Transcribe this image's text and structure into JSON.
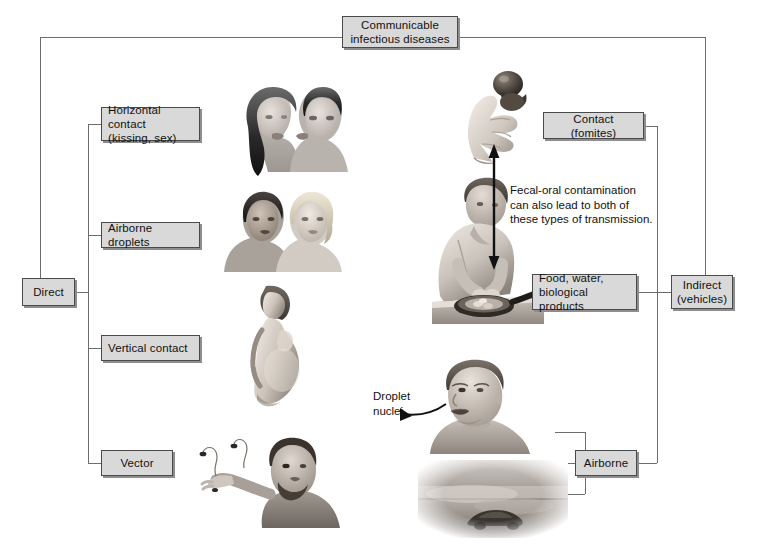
{
  "diagram": {
    "title_box": {
      "line1": "Communicable",
      "line2": "infectious diseases"
    },
    "left_branch": {
      "root_label": "Direct",
      "items": [
        {
          "label_line1": "Horizontal contact",
          "label_line2": "(kissing, sex)",
          "illustration": "couple-kissing-illustration"
        },
        {
          "label_line1": "Airborne droplets",
          "label_line2": "",
          "illustration": "two-women-talking-illustration"
        },
        {
          "label_line1": "Vertical contact",
          "label_line2": "",
          "illustration": "pregnant-woman-illustration"
        },
        {
          "label_line1": "Vector",
          "label_line2": "",
          "illustration": "man-with-insect-illustration"
        }
      ]
    },
    "right_branch": {
      "root_label_line1": "Indirect",
      "root_label_line2": "(vehicles)",
      "items": [
        {
          "label_line1": "Contact (fomites)",
          "label_line2": "",
          "illustration": "hand-holding-doorknob-illustration"
        },
        {
          "label_line1": "Food, water,",
          "label_line2": "biological products",
          "illustration": "person-cooking-illustration"
        },
        {
          "label_line1": "Airborne",
          "label_line2": "",
          "illustration": "man-speaking-droplets-illustration"
        }
      ]
    },
    "annotations": {
      "fecal_oral": {
        "line1": "Fecal-oral contamination",
        "line2": "can also lead to both of",
        "line3": "these types of transmission."
      },
      "droplet_nuclei": {
        "line1": "Droplet",
        "line2": "nuclei"
      }
    },
    "colors": {
      "box_fill": "#d9d9d9",
      "box_border": "#4a4a4a",
      "box_shadow": "#8e8e8e",
      "line": "#6d6d6d",
      "text": "#111111",
      "arrow": "#111111"
    }
  }
}
